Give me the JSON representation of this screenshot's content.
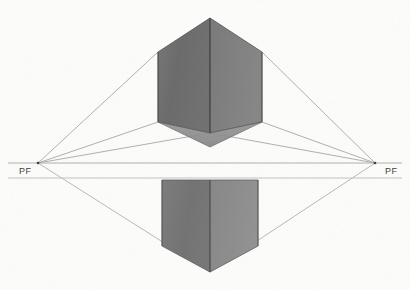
{
  "canvas": {
    "width": 410,
    "height": 290,
    "background": "#fdfdfc",
    "title": "Two-point perspective cube construction drawing"
  },
  "palette": {
    "paper": "#fdfdfc",
    "guide_line": "#8a8a8a",
    "horizon_line": "#aeaeae",
    "edge_line": "#4a4a4a",
    "label_text": "#3f3f3f",
    "upper_left_face": "#6e6e6e",
    "upper_right_face": "#7c7c7c",
    "upper_bottom_face": "#8b8b8b",
    "lower_left_face": "#747474",
    "lower_right_face": "#8a8a8a"
  },
  "horizon": {
    "name": "horizon-line",
    "y": 163,
    "x_start": 8,
    "x_end": 402,
    "secondary_y": 178,
    "secondary_x_start": 8,
    "secondary_x_end": 402
  },
  "vanishing_points": [
    {
      "id": "left",
      "label": "PF",
      "x": 38,
      "y": 163,
      "label_x": 19,
      "label_y": 166
    },
    {
      "id": "right",
      "label": "PF",
      "x": 375,
      "y": 163,
      "label_x": 385,
      "label_y": 166
    }
  ],
  "upper_cube": {
    "name": "upper-cube",
    "apex_top": {
      "x": 210,
      "y": 18
    },
    "left_top": {
      "x": 158,
      "y": 52
    },
    "right_top": {
      "x": 262,
      "y": 52
    },
    "left_bottom": {
      "x": 158,
      "y": 122
    },
    "right_bottom": {
      "x": 262,
      "y": 122
    },
    "center_vertical_top": {
      "x": 210,
      "y": 18
    },
    "center_vertical_bottom": {
      "x": 210,
      "y": 133
    },
    "faces": {
      "left": "#6e6e6e",
      "right": "#7c7c7c",
      "bottom": "#8b8b8b"
    }
  },
  "lower_cube": {
    "name": "lower-cube",
    "left_top": {
      "x": 162,
      "y": 180
    },
    "right_top": {
      "x": 258,
      "y": 180
    },
    "left_bottom": {
      "x": 162,
      "y": 246
    },
    "right_bottom": {
      "x": 258,
      "y": 246
    },
    "center_vertical_top": {
      "x": 210,
      "y": 180
    },
    "center_vertical_bottom": {
      "x": 210,
      "y": 272
    },
    "faces": {
      "left": "#747474",
      "right": "#8a8a8a"
    }
  },
  "guide_lines": {
    "upper_left_fan": [
      {
        "from": {
          "x": 38,
          "y": 163
        },
        "to": {
          "x": 158,
          "y": 52
        }
      },
      {
        "from": {
          "x": 38,
          "y": 163
        },
        "to": {
          "x": 158,
          "y": 122
        }
      },
      {
        "from": {
          "x": 38,
          "y": 163
        },
        "to": {
          "x": 210,
          "y": 133
        }
      }
    ],
    "upper_right_fan": [
      {
        "from": {
          "x": 375,
          "y": 163
        },
        "to": {
          "x": 262,
          "y": 52
        }
      },
      {
        "from": {
          "x": 375,
          "y": 163
        },
        "to": {
          "x": 262,
          "y": 122
        }
      },
      {
        "from": {
          "x": 375,
          "y": 163
        },
        "to": {
          "x": 210,
          "y": 133
        }
      }
    ],
    "lower_left_fan": [
      {
        "from": {
          "x": 38,
          "y": 163
        },
        "to": {
          "x": 210,
          "y": 272
        }
      }
    ],
    "lower_right_fan": [
      {
        "from": {
          "x": 375,
          "y": 163
        },
        "to": {
          "x": 210,
          "y": 272
        }
      }
    ]
  }
}
